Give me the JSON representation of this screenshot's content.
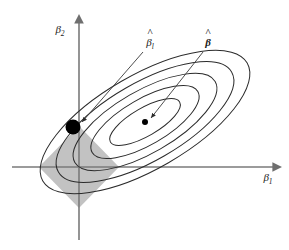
{
  "figure": {
    "background_color": "#ffffff",
    "width": 289,
    "height": 250
  },
  "axes": {
    "x_axis": {
      "name": "beta-1-axis",
      "label": "β",
      "subscript": "1",
      "label_x": 268,
      "label_y": 181,
      "color": "#7a7a7a",
      "start_x": 12,
      "end_x": 280,
      "y": 167
    },
    "y_axis": {
      "name": "beta-2-axis",
      "label": "β",
      "subscript": "2",
      "label_x": 60,
      "label_y": 33,
      "color": "#7a7a7a",
      "x": 79,
      "start_y": 240,
      "end_y": 15
    }
  },
  "constraint_region": {
    "name": "l1-diamond",
    "shape": "diamond",
    "fill_color": "#c2c2c2",
    "center_x": 79,
    "center_y": 167,
    "half_width": 40,
    "half_height": 41,
    "description": "L1 norm constraint region |beta1| + |beta2| <= t"
  },
  "contours": {
    "name": "rss-ellipses",
    "count": 5,
    "stroke_color": "#2b2b2b",
    "stroke_width": 1,
    "center_x": 145,
    "center_y": 122,
    "rotation_deg": -30,
    "levels": [
      {
        "rx": 118,
        "ry": 47
      },
      {
        "rx": 100,
        "ry": 39
      },
      {
        "rx": 81,
        "ry": 31
      },
      {
        "rx": 61,
        "ry": 23
      },
      {
        "rx": 40,
        "ry": 14
      }
    ]
  },
  "points": [
    {
      "name": "lasso-solution-point",
      "label": "β",
      "subscript": "l",
      "accent": "hat",
      "x": 73,
      "y": 127,
      "radius": 7.5,
      "color": "#000000",
      "label_x": 150,
      "label_y": 46,
      "leader_from_x": 143,
      "leader_from_y": 52,
      "leader_to_x": 82,
      "leader_to_y": 122
    },
    {
      "name": "ols-estimate-point",
      "label": "β",
      "subscript": "",
      "accent": "hat",
      "x": 145,
      "y": 122,
      "radius": 3,
      "color": "#000000",
      "label_x": 208,
      "label_y": 46,
      "leader_from_x": 203,
      "leader_from_y": 52,
      "leader_to_x": 151,
      "leader_to_y": 118
    }
  ],
  "leader_lines": {
    "name": "annotation-leaders",
    "stroke_color": "#3a3a3a",
    "stroke_width": 0.9
  }
}
